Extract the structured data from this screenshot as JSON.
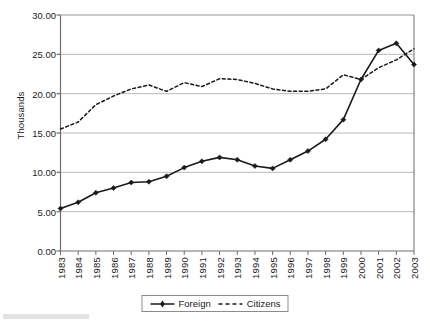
{
  "chart_data": {
    "type": "line",
    "title": "",
    "subtitle": "",
    "xlabel": "",
    "ylabel": "Thousands",
    "categories": [
      "1983",
      "1984",
      "1985",
      "1986",
      "1987",
      "1988",
      "1989",
      "1990",
      "1991",
      "1992",
      "1993",
      "1994",
      "1995",
      "1996",
      "1997",
      "1998",
      "1999",
      "2000",
      "2001",
      "2002",
      "2003"
    ],
    "x": [
      1983,
      1984,
      1985,
      1986,
      1987,
      1988,
      1989,
      1990,
      1991,
      1992,
      1993,
      1994,
      1995,
      1996,
      1997,
      1998,
      1999,
      2000,
      2001,
      2002,
      2003
    ],
    "series": [
      {
        "name": "Foreign",
        "style": "solid",
        "marker": "filled-diamond",
        "color": "#1a1a1a",
        "values": [
          5.4,
          6.2,
          7.4,
          8.0,
          8.7,
          8.8,
          9.5,
          10.6,
          11.4,
          11.9,
          11.6,
          10.8,
          10.5,
          11.6,
          12.7,
          14.2,
          16.7,
          21.8,
          25.5,
          26.4,
          23.7
        ]
      },
      {
        "name": "Citizens",
        "style": "dashed",
        "marker": "none",
        "color": "#1a1a1a",
        "values": [
          15.5,
          16.4,
          18.6,
          19.7,
          20.6,
          21.1,
          20.3,
          21.4,
          20.9,
          21.9,
          21.8,
          21.3,
          20.6,
          20.3,
          20.3,
          20.6,
          22.4,
          21.8,
          23.3,
          24.3,
          25.7
        ]
      }
    ],
    "ylim": [
      0.0,
      30.0
    ],
    "ytick_values": [
      0.0,
      5.0,
      10.0,
      15.0,
      20.0,
      25.0,
      30.0
    ],
    "ytick_labels": [
      "0.00",
      "5.00",
      "10.00",
      "15.00",
      "20.00",
      "25.00",
      "30.00"
    ],
    "grid": "horizontal",
    "grid_color": "#b8b8b8",
    "axis_color": "#6e6e6e",
    "legend_position": "bottom-center",
    "legend_entries": [
      "Foreign",
      "Citizens"
    ],
    "plot_bg": "#ffffff"
  }
}
